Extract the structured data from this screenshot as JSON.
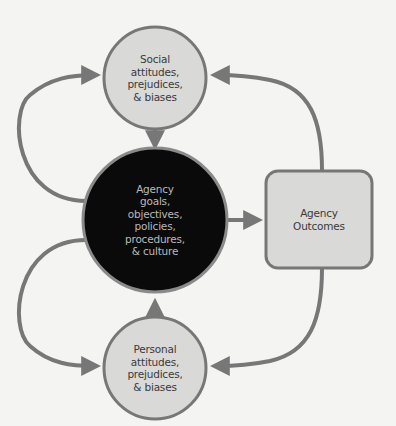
{
  "diagram": {
    "colors": {
      "background": "#f4f4f2",
      "light_node_fill": "#d9d9d7",
      "dark_node_fill": "#0a0a0a",
      "stroke": "#777777",
      "dark_text": "#3a3a3a",
      "light_text": "#b9b9b9"
    },
    "nodes": {
      "social": {
        "shape": "circle",
        "lines": [
          "Social",
          "attitudes,",
          "prejudices,",
          "& biases"
        ]
      },
      "agency": {
        "shape": "circle",
        "lines": [
          "Agency",
          "goals,",
          "objectives,",
          "policies,",
          "procedures,",
          "& culture"
        ]
      },
      "personal": {
        "shape": "circle",
        "lines": [
          "Personal",
          "attitudes,",
          "prejudices,",
          "& biases"
        ]
      },
      "outcomes": {
        "shape": "rounded-rectangle",
        "lines": [
          "Agency",
          "Outcomes"
        ]
      }
    },
    "edges": [
      {
        "from": "social",
        "to": "agency"
      },
      {
        "from": "personal",
        "to": "agency"
      },
      {
        "from": "agency",
        "to": "outcomes"
      },
      {
        "from": "agency",
        "to": "social"
      },
      {
        "from": "agency",
        "to": "personal"
      },
      {
        "from": "outcomes",
        "to": "social"
      },
      {
        "from": "outcomes",
        "to": "personal"
      }
    ]
  }
}
